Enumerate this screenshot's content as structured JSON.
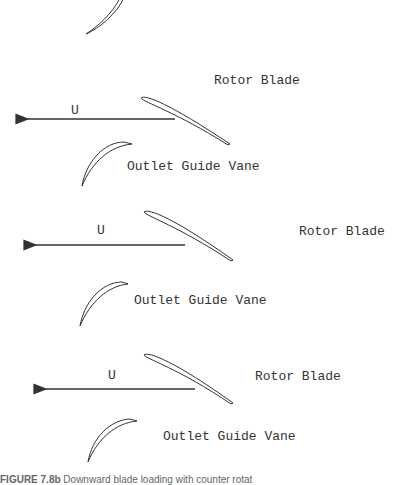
{
  "diagram": {
    "stages": [
      {
        "rotor_label": "Rotor Blade",
        "ogv_label": "Outlet Guide Vane",
        "velocity_label": "U"
      },
      {
        "rotor_label": "Rotor Blade",
        "ogv_label": "Outlet Guide Vane",
        "velocity_label": "U"
      },
      {
        "rotor_label": "Rotor Blade",
        "ogv_label": "Outlet Guide Vane",
        "velocity_label": "U"
      }
    ],
    "caption": {
      "figure_number": "FIGURE 7.8b",
      "text": "Downward blade loading with counter rotat"
    },
    "colors": {
      "stroke": "#333333",
      "background": "#ffffff"
    }
  }
}
